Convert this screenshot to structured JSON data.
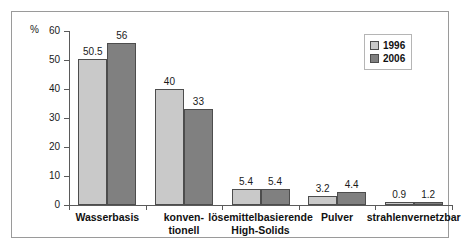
{
  "chart_data": {
    "type": "bar",
    "title": "",
    "xlabel": "",
    "ylabel": "%",
    "ylim": [
      0,
      60
    ],
    "yticks": [
      0,
      10,
      20,
      30,
      40,
      50,
      60
    ],
    "grid": false,
    "legend_position": "top-right",
    "categories": [
      "Wasserbasis",
      "konven-\ntionell",
      "lösemittelbasierende\nHigh-Solids",
      "Pulver",
      "strahlenvernetzbar"
    ],
    "series": [
      {
        "name": "1996",
        "color": "#c9c9c9",
        "values": [
          50.5,
          40,
          5.4,
          3.2,
          0.9
        ],
        "labels": [
          "50.5",
          "40",
          "5.4",
          "3.2",
          "0.9"
        ]
      },
      {
        "name": "2006",
        "color": "#808080",
        "values": [
          56,
          33,
          5.4,
          4.4,
          1.2
        ],
        "labels": [
          "56",
          "33",
          "5.4",
          "4.4",
          "1.2"
        ]
      }
    ]
  },
  "axis": {
    "unit_label": "%",
    "tick_labels": [
      "60",
      "50",
      "40",
      "30",
      "20",
      "10",
      "0"
    ]
  },
  "legend": {
    "entries": [
      {
        "label": "1996"
      },
      {
        "label": "2006"
      }
    ]
  }
}
